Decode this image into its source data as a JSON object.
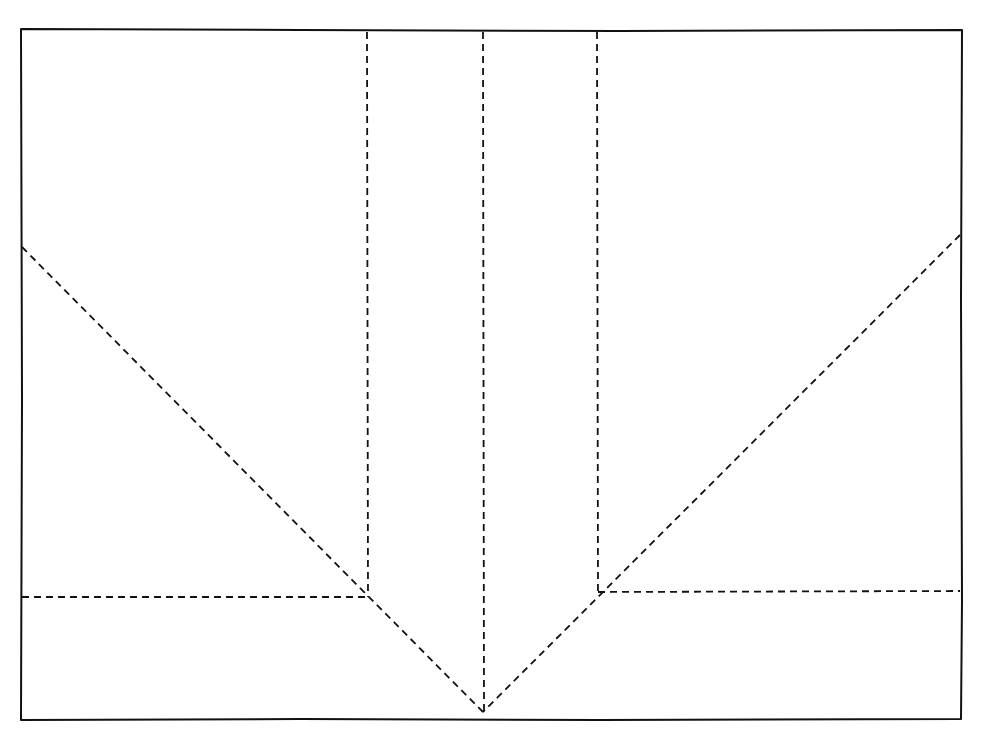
{
  "diagram": {
    "title": "",
    "colors": {
      "line": "#111111",
      "background": "#ffffff"
    },
    "elements": [
      {
        "id": "frame",
        "kind": "solid-rectangle",
        "role": "sheet outline"
      },
      {
        "id": "vertical-fold-left",
        "kind": "dashed-line",
        "from": "top edge",
        "to": "left intersection"
      },
      {
        "id": "vertical-fold-center",
        "kind": "dashed-line",
        "from": "top edge",
        "to": "bottom apex"
      },
      {
        "id": "vertical-fold-right",
        "kind": "dashed-line",
        "from": "top edge",
        "to": "right intersection"
      },
      {
        "id": "diagonal-fold-left",
        "kind": "dashed-line",
        "from": "left edge",
        "to": "bottom apex"
      },
      {
        "id": "diagonal-fold-right",
        "kind": "dashed-line",
        "from": "right edge",
        "to": "bottom apex"
      },
      {
        "id": "horizontal-fold-left",
        "kind": "dashed-line",
        "from": "left edge",
        "to": "left intersection"
      },
      {
        "id": "horizontal-fold-right",
        "kind": "dashed-line",
        "from": "right intersection",
        "to": "right edge"
      }
    ]
  }
}
